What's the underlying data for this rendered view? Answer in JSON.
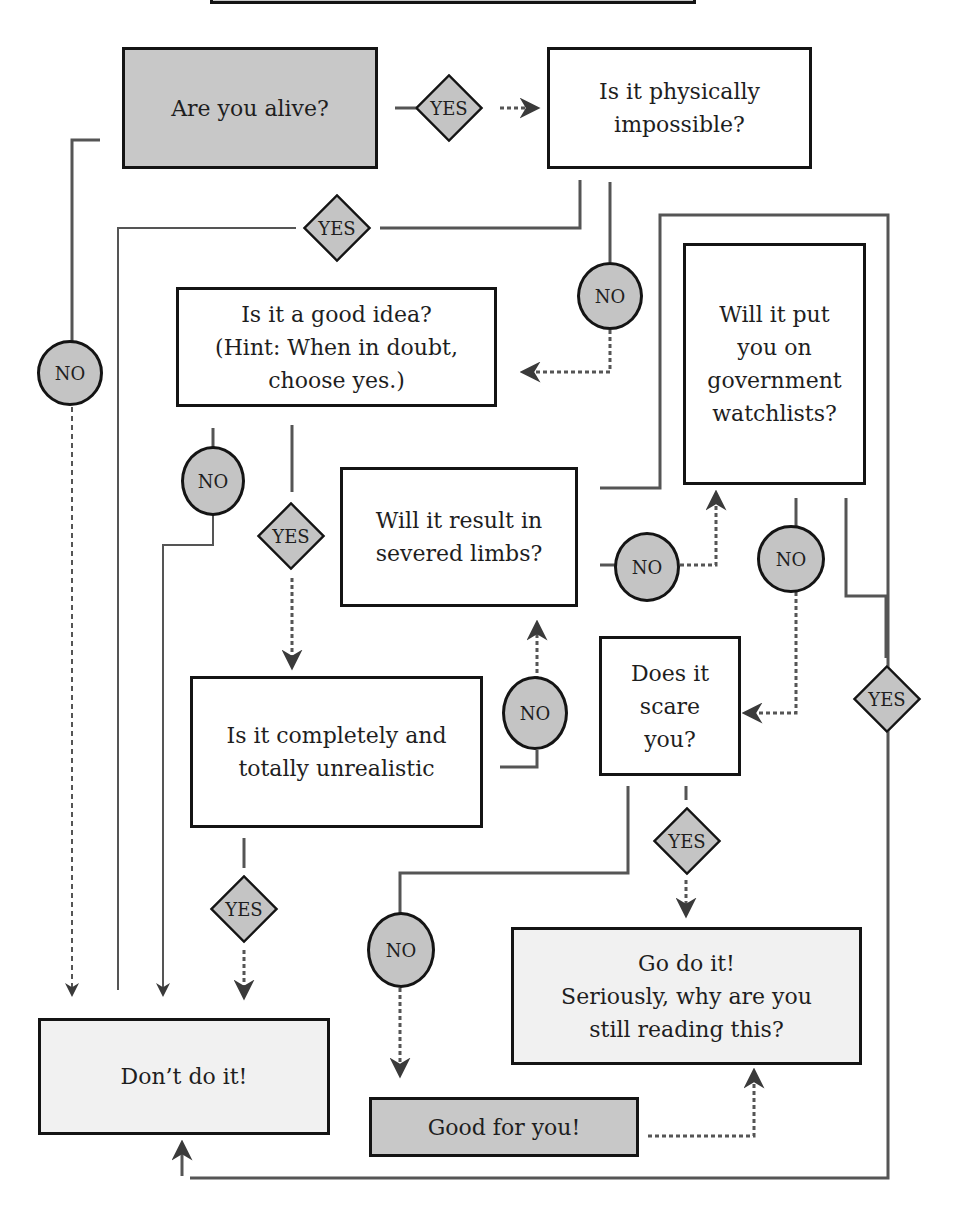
{
  "diagram": {
    "nodes": {
      "alive": "Are you alive?",
      "physically_impossible": "Is it physically\nimpossible?",
      "good_idea": "Is it a good idea?\n(Hint: When in doubt,\nchoose yes.)",
      "watchlists": "Will it put\nyou on\ngovernment\nwatchlists?",
      "severed_limbs": "Will it result in\nsevered limbs?",
      "unrealistic": "Is it completely and\ntotally unrealistic",
      "scare": "Does it\nscare\nyou?",
      "go_do_it": "Go do it!\nSeriously, why are you\nstill reading this?",
      "dont_do_it": "Don’t do it!",
      "good_for_you": "Good for you!"
    },
    "labels": {
      "yes": "YES",
      "no": "NO"
    },
    "colors": {
      "ink": "#141414",
      "line": "#555555",
      "fill_gray": "#c4c4c4",
      "fill_light": "#f1f1f1",
      "fill_white": "#ffffff"
    },
    "edges": [
      {
        "from": "alive",
        "to": "physically_impossible",
        "label": "YES"
      },
      {
        "from": "alive",
        "to": "dont_do_it",
        "label": "NO"
      },
      {
        "from": "physically_impossible",
        "to": "dont_do_it",
        "label": "YES"
      },
      {
        "from": "physically_impossible",
        "to": "good_idea",
        "label": "NO"
      },
      {
        "from": "good_idea",
        "to": "dont_do_it",
        "label": "NO"
      },
      {
        "from": "good_idea",
        "to": "unrealistic",
        "label": "YES"
      },
      {
        "from": "unrealistic",
        "to": "dont_do_it",
        "label": "YES"
      },
      {
        "from": "unrealistic",
        "to": "severed_limbs",
        "label": "NO"
      },
      {
        "from": "severed_limbs",
        "to": "watchlists",
        "label": "NO"
      },
      {
        "from": "watchlists",
        "to": "scare",
        "label": "NO"
      },
      {
        "from": "watchlists",
        "to": "dont_do_it",
        "label": "YES"
      },
      {
        "from": "scare",
        "to": "go_do_it",
        "label": "YES"
      },
      {
        "from": "scare",
        "to": "good_for_you",
        "label": "NO"
      },
      {
        "from": "good_for_you",
        "to": "go_do_it",
        "label": ""
      }
    ]
  }
}
